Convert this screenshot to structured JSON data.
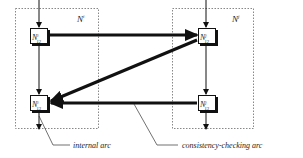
{
  "diagram": {
    "networks": [
      {
        "id": "left",
        "label_base": "N",
        "label_sup": "i"
      },
      {
        "id": "right",
        "label_base": "N",
        "label_sup": "j"
      }
    ],
    "nodes": [
      {
        "id": "left-top",
        "base": "N",
        "sup": "i",
        "sub": "12"
      },
      {
        "id": "left-bottom",
        "base": "N",
        "sup": "i",
        "sub": "13"
      },
      {
        "id": "right-top",
        "base": "N",
        "sup": "j",
        "sub": "12"
      },
      {
        "id": "right-bottom",
        "base": "N",
        "sup": "j",
        "sub": "13"
      }
    ],
    "arcs": [
      {
        "from": "left-top",
        "to": "right-top",
        "type": "consistency-checking"
      },
      {
        "from": "right-top",
        "to": "left-bottom",
        "type": "consistency-checking"
      },
      {
        "from": "right-bottom",
        "to": "left-bottom",
        "type": "consistency-checking"
      },
      {
        "from": "left-top",
        "to": "left-bottom",
        "type": "internal"
      },
      {
        "from": "right-top",
        "to": "right-bottom",
        "type": "internal"
      }
    ],
    "legend": {
      "internal": "internal arc",
      "consistency": "consistency-checking arc"
    },
    "colors": {
      "line": "#111111",
      "box_border": "#777777",
      "node_fill": "#ffffff",
      "shadow": "#111111"
    }
  }
}
